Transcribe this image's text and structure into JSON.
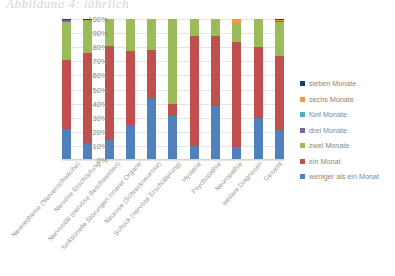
{
  "handwriting_note": "Abbildung 4: jährlich",
  "chart_data": {
    "type": "bar",
    "subtype": "stacked-100-percent",
    "title": "",
    "xlabel": "",
    "ylabel": "",
    "ylim": [
      0,
      100
    ],
    "ytick_labels": [
      "100%",
      "90%",
      "80%",
      "70%",
      "60%",
      "50%",
      "40%",
      "30%",
      "20%",
      "10%",
      "0%"
    ],
    "ytick_values": [
      100,
      90,
      80,
      70,
      60,
      50,
      40,
      30,
      20,
      10,
      0
    ],
    "grid": true,
    "legend_position": "right",
    "stack_order_bottom_to_top": [
      "weniger als ein Monat",
      "ein Monat",
      "zwei Monate",
      "drei Monate",
      "fünf Monate",
      "sechs Monate",
      "sieben Monate"
    ],
    "categories": [
      "Neurasthenie (Nervenschwäche)",
      "Nervöse Erschöpfung",
      "Nervosität (nervöse Beschwerden)",
      "funktionelle Störungen innerer Organe",
      "Neurose (Schreckneurose)",
      "Schock (nervöse Erschütterung)",
      "Hysterie",
      "Psychopathie",
      "Neuropathie",
      "weitere Diagnosen",
      "Gesamt"
    ],
    "series": [
      {
        "name": "weniger als ein Monat",
        "color": "#4F81BD",
        "values": [
          22,
          12,
          14,
          25,
          44,
          31,
          10,
          38,
          9,
          30,
          21
        ]
      },
      {
        "name": "ein Monat",
        "color": "#C0504D",
        "values": [
          49,
          64,
          67,
          52,
          34,
          9,
          78,
          50,
          75,
          50,
          53
        ]
      },
      {
        "name": "zwei Monate",
        "color": "#9BBB59",
        "values": [
          27,
          23,
          19,
          23,
          22,
          60,
          12,
          12,
          13,
          20,
          24
        ]
      },
      {
        "name": "drei Monate",
        "color": "#8064A2",
        "values": [
          1,
          0.5,
          0,
          0,
          0,
          0,
          0,
          0,
          0,
          0,
          0.6
        ]
      },
      {
        "name": "fünf Monate",
        "color": "#4BACC6",
        "values": [
          0.5,
          0,
          0,
          0,
          0,
          0,
          0,
          0,
          0,
          0,
          0.2
        ]
      },
      {
        "name": "sechs Monate",
        "color": "#F79646",
        "values": [
          0,
          0,
          0,
          0,
          0,
          0,
          0,
          0,
          3,
          0,
          0.2
        ]
      },
      {
        "name": "sieben Monate",
        "color": "#1F3864",
        "values": [
          0.5,
          0.5,
          0,
          0,
          0,
          0,
          0,
          0,
          0,
          0,
          1
        ]
      }
    ],
    "legend_entries": [
      {
        "label": "sieben Monate",
        "color": "#1F3864"
      },
      {
        "label": "sechs Monate",
        "color": "#F79646"
      },
      {
        "label": "fünf Monate",
        "color": "#4BACC6"
      },
      {
        "label": "drei Monate",
        "color": "#8064A2"
      },
      {
        "label": "zwei Monate",
        "color": "#9BBB59"
      },
      {
        "label": "ein Monat",
        "color": "#C0504D"
      },
      {
        "label": "weniger als ein Monat",
        "color": "#4F81BD"
      }
    ]
  }
}
